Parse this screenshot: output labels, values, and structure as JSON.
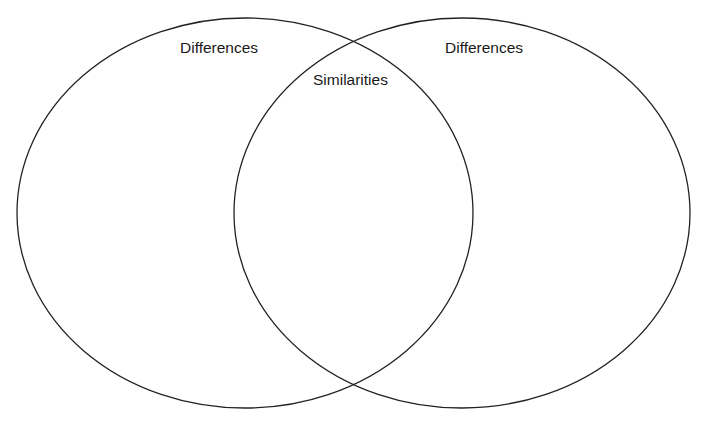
{
  "diagram": {
    "type": "venn",
    "sets": [
      {
        "id": "left",
        "label": "Differences",
        "shape": {
          "cx": 245,
          "cy": 213,
          "rx": 228,
          "ry": 195
        }
      },
      {
        "id": "right",
        "label": "Differences",
        "shape": {
          "cx": 462,
          "cy": 213,
          "rx": 228,
          "ry": 195
        }
      }
    ],
    "intersection": {
      "label": "Similarities"
    },
    "stroke_color": "#222222",
    "background_color": "#ffffff"
  }
}
